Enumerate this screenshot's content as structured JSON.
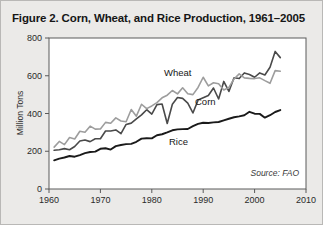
{
  "figure": {
    "title": "Figure 2. Corn, Wheat, and Rice Production, 1961–2005",
    "source_note": "Source: FAO",
    "background_color": "#ebeae8",
    "plot_background_color": "#ffffff"
  },
  "chart_data": {
    "type": "line",
    "title": "Figure 2. Corn, Wheat, and Rice Production, 1961–2005",
    "xlabel": "",
    "ylabel": "Million Tons",
    "xlim": [
      1960,
      2010
    ],
    "ylim": [
      0,
      800
    ],
    "xticks": [
      1960,
      1970,
      1980,
      1990,
      2000,
      2010
    ],
    "xtick_labels": [
      "1960",
      "1970",
      "1980",
      "1990",
      "2000",
      "2010"
    ],
    "yticks": [
      0,
      200,
      400,
      600,
      800
    ],
    "ytick_labels": [
      "0",
      "200",
      "400",
      "600",
      "800"
    ],
    "grid": false,
    "legend": "inline-annotations",
    "annotations": [
      {
        "text": "Wheat",
        "x": 1986,
        "y": 555
      },
      {
        "text": "Corn",
        "x": 1991,
        "y": 455
      },
      {
        "text": "Rice",
        "x": 1987,
        "y": 250
      },
      {
        "text": "Source: FAO",
        "x": 2004,
        "y": 105
      }
    ],
    "x": [
      1961,
      1962,
      1963,
      1964,
      1965,
      1966,
      1967,
      1968,
      1969,
      1970,
      1971,
      1972,
      1973,
      1974,
      1975,
      1976,
      1977,
      1978,
      1979,
      1980,
      1981,
      1982,
      1983,
      1984,
      1985,
      1986,
      1987,
      1988,
      1989,
      1990,
      1991,
      1992,
      1993,
      1994,
      1995,
      1996,
      1997,
      1998,
      1999,
      2000,
      2001,
      2002,
      2003,
      2004,
      2005
    ],
    "series": [
      {
        "name": "Corn",
        "color": "#4a4a4a",
        "line_width": 1.6,
        "units": "million tons",
        "values": [
          205,
          208,
          214,
          208,
          225,
          254,
          260,
          251,
          266,
          266,
          307,
          307,
          313,
          293,
          342,
          349,
          372,
          393,
          420,
          397,
          447,
          450,
          347,
          449,
          485,
          480,
          455,
          403,
          471,
          483,
          495,
          535,
          477,
          570,
          517,
          589,
          585,
          615,
          607,
          592,
          615,
          604,
          645,
          729,
          696
        ]
      },
      {
        "name": "Wheat",
        "color": "#9d9d9d",
        "line_width": 1.6,
        "units": "million tons",
        "values": [
          222,
          252,
          235,
          273,
          265,
          306,
          301,
          333,
          317,
          318,
          353,
          348,
          377,
          360,
          356,
          421,
          386,
          449,
          426,
          440,
          458,
          483,
          497,
          522,
          504,
          536,
          505,
          500,
          538,
          592,
          546,
          563,
          558,
          525,
          538,
          583,
          610,
          589,
          586,
          585,
          589,
          574,
          560,
          627,
          624
        ]
      },
      {
        "name": "Rice",
        "color": "#1a1a1a",
        "line_width": 1.9,
        "units": "million tons",
        "values": [
          152,
          161,
          167,
          175,
          171,
          180,
          190,
          196,
          198,
          213,
          216,
          209,
          227,
          233,
          238,
          239,
          250,
          267,
          269,
          268,
          285,
          290,
          300,
          311,
          316,
          317,
          318,
          333,
          345,
          351,
          350,
          353,
          355,
          364,
          372,
          380,
          385,
          391,
          409,
          399,
          398,
          378,
          391,
          408,
          418
        ]
      }
    ]
  },
  "axes": {
    "y_axis_title": "Million Tons",
    "y_labels": [
      "800",
      "600",
      "400",
      "200",
      "0"
    ],
    "x_labels": [
      "1960",
      "1970",
      "1980",
      "1990",
      "2000",
      "2010"
    ]
  },
  "series_labels": {
    "wheat": "Wheat",
    "corn": "Corn",
    "rice": "Rice"
  }
}
